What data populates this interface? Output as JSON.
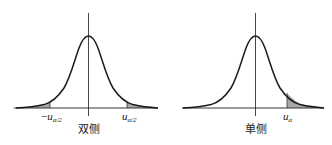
{
  "panels": [
    {
      "id": "two-sided",
      "caption": "双侧",
      "labels": {
        "left_minus": "−",
        "left_var": "u",
        "left_sub": "α/2",
        "right_var": "u",
        "right_sub": "α/2"
      },
      "shaded_tails": [
        "left",
        "right"
      ]
    },
    {
      "id": "one-sided",
      "caption": "单侧",
      "labels": {
        "right_var": "u",
        "right_sub": "α"
      },
      "shaded_tails": [
        "right"
      ]
    }
  ],
  "colors": {
    "curve": "#1a1a1a",
    "axis": "#333333",
    "shade": "#a8a8a8"
  }
}
